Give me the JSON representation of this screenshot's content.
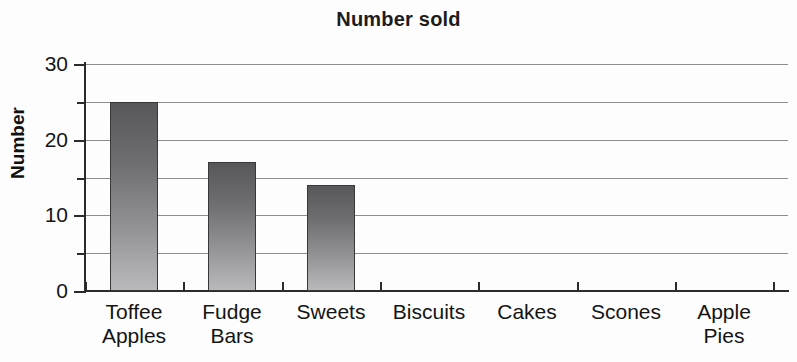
{
  "chart_data": {
    "type": "bar",
    "title": "Number sold",
    "xlabel": "",
    "ylabel": "Number",
    "categories": [
      "Toffee Apples",
      "Fudge Bars",
      "Sweets",
      "Biscuits",
      "Cakes",
      "Scones",
      "Apple Pies"
    ],
    "category_lines": [
      [
        "Toffee",
        "Apples"
      ],
      [
        "Fudge",
        "Bars"
      ],
      [
        "Sweets"
      ],
      [
        "Biscuits"
      ],
      [
        "Cakes"
      ],
      [
        "Scones"
      ],
      [
        "Apple",
        "Pies"
      ]
    ],
    "values": [
      25,
      17,
      14,
      0,
      0,
      0,
      0
    ],
    "ylim": [
      0,
      30
    ],
    "y_major_ticks": [
      0,
      10,
      20,
      30
    ],
    "y_major_tick_labels": [
      "0",
      "10",
      "20",
      "30"
    ],
    "y_minor_ticks": [
      5,
      15,
      25
    ],
    "gridlines": [
      5,
      10,
      15,
      20,
      25,
      30
    ],
    "grid": true,
    "legend": false,
    "bar_color_top": "#58585a",
    "bar_color_bottom": "#b9b9bb",
    "axis_color": "#2b2b2b",
    "grid_color": "#8d8d8d",
    "text_color": "#141414"
  }
}
